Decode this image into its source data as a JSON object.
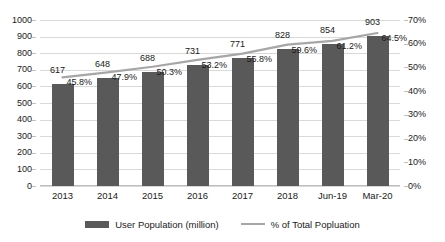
{
  "chart_data": {
    "type": "bar",
    "title": "",
    "subtitle": "",
    "xlabel": "",
    "ylabel": "",
    "categories": [
      "2013",
      "2014",
      "2015",
      "2016",
      "2017",
      "2018",
      "Jun-19",
      "Mar-20"
    ],
    "series": [
      {
        "name": "User Population (million)",
        "type": "bar",
        "axis": "left",
        "color": "#595959",
        "values": [
          617,
          648,
          688,
          731,
          771,
          828,
          854,
          903
        ],
        "labels": [
          "617",
          "648",
          "688",
          "731",
          "771",
          "828",
          "854",
          "903"
        ]
      },
      {
        "name": "% of Total Popluation",
        "type": "line",
        "axis": "right",
        "color": "#a6a6a6",
        "values": [
          45.8,
          47.9,
          50.3,
          53.2,
          55.8,
          59.6,
          61.2,
          64.5
        ],
        "labels": [
          "45.8%",
          "47.9%",
          "50.3%",
          "53.2%",
          "55.8%",
          "59.6%",
          "61.2%",
          "64.5%"
        ]
      }
    ],
    "y_left": {
      "min": 0,
      "max": 1000,
      "step": 100,
      "ticks": [
        "0",
        "100",
        "200",
        "300",
        "400",
        "500",
        "600",
        "700",
        "800",
        "900",
        "1000"
      ]
    },
    "y_right": {
      "min": 0,
      "max": 70,
      "step": 10,
      "ticks": [
        "0%",
        "10%",
        "20%",
        "30%",
        "40%",
        "50%",
        "60%",
        "70%"
      ]
    },
    "grid": true,
    "legend_position": "bottom",
    "colors": {
      "bar": "#595959",
      "line": "#a6a6a6",
      "gridline": "#d9d9d9",
      "axis": "#bfbfbf",
      "text": "#1a1a1a",
      "background": "#ffffff"
    }
  },
  "legend": {
    "items": [
      {
        "label": "User Population (million)",
        "marker": "bar-swatch"
      },
      {
        "label": "% of Total Popluation",
        "marker": "line-swatch"
      }
    ]
  }
}
